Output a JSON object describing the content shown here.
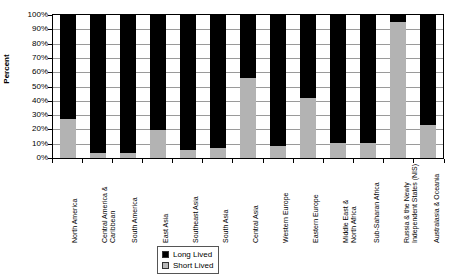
{
  "chart_data": {
    "type": "bar",
    "subtype": "stacked-100-percent",
    "title": "",
    "xlabel": "",
    "ylabel": "Percent",
    "ylim": [
      0,
      100
    ],
    "ytick_labels": [
      "100%",
      "90%",
      "80%",
      "70%",
      "60%",
      "50%",
      "40%",
      "30%",
      "20%",
      "10%",
      "0%"
    ],
    "ytick_values": [
      100,
      90,
      80,
      70,
      60,
      50,
      40,
      30,
      20,
      10,
      0
    ],
    "grid": true,
    "legend_position": "bottom-center",
    "categories": [
      "North America",
      "Central America & Caribbean",
      "South America",
      "East Asia",
      "Southeast Asia",
      "South Asia",
      "Central Asia",
      "Western Europe",
      "Eastern Europe",
      "Middle East & North Africa",
      "Sub-Saharan Africa",
      "Russia & the Newly Independent States (NIS)",
      "Australasia & Oceania"
    ],
    "category_lines": [
      [
        "North America"
      ],
      [
        "Central America &",
        "Caribbean"
      ],
      [
        "South America"
      ],
      [
        "East Asia"
      ],
      [
        "Southeast Asia"
      ],
      [
        "South Asia"
      ],
      [
        "Central Asia"
      ],
      [
        "Western Europe"
      ],
      [
        "Eastern Europe"
      ],
      [
        "Middle East &",
        "North Africa"
      ],
      [
        "Sub-Saharan Africa"
      ],
      [
        "Russia & the Newly",
        "Independent States (NIS)"
      ],
      [
        "Australasia & Oceania"
      ]
    ],
    "series": [
      {
        "name": "Long Lived",
        "color": "#000000",
        "values": [
          72,
          96,
          96,
          80,
          94,
          92,
          43,
          91,
          57,
          89,
          89,
          4,
          76
        ]
      },
      {
        "name": "Short Lived",
        "color": "#b3b3b3",
        "values": [
          28,
          4,
          4,
          20,
          6,
          8,
          57,
          9,
          43,
          11,
          11,
          96,
          24
        ]
      }
    ]
  },
  "legend": {
    "items": [
      {
        "label": "Long Lived",
        "swatch": "black-square-icon"
      },
      {
        "label": "Short Lived",
        "swatch": "gray-square-icon"
      }
    ]
  }
}
